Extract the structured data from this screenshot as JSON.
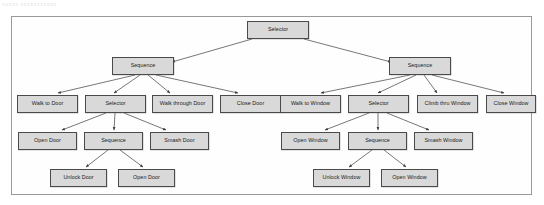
{
  "figure": {
    "caption_fragment": "xxxxx xxxxxxxxxxx",
    "frame_label": "behavior-tree-diagram"
  },
  "diagram": {
    "type": "behavior-tree",
    "node_types": [
      "Selector",
      "Sequence",
      "Action"
    ],
    "nodes": [
      {
        "id": "root",
        "label": "Selector",
        "type": "Selector",
        "x": 247,
        "y": 21,
        "w": 62,
        "h": 18
      },
      {
        "id": "seq-door",
        "label": "Sequence",
        "type": "Sequence",
        "x": 112,
        "y": 57,
        "w": 62,
        "h": 18
      },
      {
        "id": "seq-window",
        "label": "Sequence",
        "type": "Sequence",
        "x": 389,
        "y": 57,
        "w": 62,
        "h": 18
      },
      {
        "id": "walk-to-door",
        "label": "Walk to Door",
        "type": "Action",
        "x": 17,
        "y": 95,
        "w": 61,
        "h": 18
      },
      {
        "id": "sel-door",
        "label": "Selector",
        "type": "Selector",
        "x": 85,
        "y": 95,
        "w": 61,
        "h": 18
      },
      {
        "id": "walk-thru-door",
        "label": "Walk through Door",
        "type": "Action",
        "x": 152,
        "y": 95,
        "w": 61,
        "h": 18
      },
      {
        "id": "close-door",
        "label": "Close Door",
        "type": "Action",
        "x": 220,
        "y": 95,
        "w": 61,
        "h": 18
      },
      {
        "id": "walk-to-window",
        "label": "Walk to Window",
        "type": "Action",
        "x": 280,
        "y": 95,
        "w": 61,
        "h": 18
      },
      {
        "id": "sel-window",
        "label": "Selector",
        "type": "Selector",
        "x": 348,
        "y": 95,
        "w": 61,
        "h": 18
      },
      {
        "id": "climb-thru-win",
        "label": "Climb thru Window",
        "type": "Action",
        "x": 417,
        "y": 95,
        "w": 61,
        "h": 18
      },
      {
        "id": "close-window",
        "label": "Close Window",
        "type": "Action",
        "x": 486,
        "y": 95,
        "w": 50,
        "h": 18
      },
      {
        "id": "open-door-1",
        "label": "Open Door",
        "type": "Action",
        "x": 18,
        "y": 132,
        "w": 59,
        "h": 18
      },
      {
        "id": "seq-unlock-door",
        "label": "Sequence",
        "type": "Sequence",
        "x": 84,
        "y": 132,
        "w": 59,
        "h": 18
      },
      {
        "id": "smash-door",
        "label": "Smash Door",
        "type": "Action",
        "x": 150,
        "y": 132,
        "w": 59,
        "h": 18
      },
      {
        "id": "open-window-1",
        "label": "Open Window",
        "type": "Action",
        "x": 281,
        "y": 132,
        "w": 59,
        "h": 18
      },
      {
        "id": "seq-unlock-win",
        "label": "Sequence",
        "type": "Sequence",
        "x": 348,
        "y": 132,
        "w": 59,
        "h": 18
      },
      {
        "id": "smash-window",
        "label": "Smash Window",
        "type": "Action",
        "x": 414,
        "y": 132,
        "w": 59,
        "h": 18
      },
      {
        "id": "unlock-door",
        "label": "Unlock Door",
        "type": "Action",
        "x": 50,
        "y": 169,
        "w": 57,
        "h": 18
      },
      {
        "id": "open-door-2",
        "label": "Open Door",
        "type": "Action",
        "x": 118,
        "y": 169,
        "w": 57,
        "h": 18
      },
      {
        "id": "unlock-window",
        "label": "Unlock Window",
        "type": "Action",
        "x": 313,
        "y": 169,
        "w": 57,
        "h": 18
      },
      {
        "id": "open-window-2",
        "label": "Open Window",
        "type": "Action",
        "x": 381,
        "y": 169,
        "w": 57,
        "h": 18
      }
    ],
    "edges": [
      {
        "from": "root",
        "to": "seq-door",
        "x1": 252,
        "y1": 39,
        "x2": 172,
        "y2": 62
      },
      {
        "from": "root",
        "to": "seq-window",
        "x1": 304,
        "y1": 39,
        "x2": 391,
        "y2": 62
      },
      {
        "from": "seq-door",
        "to": "walk-to-door",
        "x1": 135,
        "y1": 75,
        "x2": 58,
        "y2": 93
      },
      {
        "from": "seq-door",
        "to": "sel-door",
        "x1": 140,
        "y1": 75,
        "x2": 114,
        "y2": 93
      },
      {
        "from": "seq-door",
        "to": "walk-thru-door",
        "x1": 148,
        "y1": 75,
        "x2": 170,
        "y2": 93
      },
      {
        "from": "seq-door",
        "to": "close-door",
        "x1": 156,
        "y1": 75,
        "x2": 238,
        "y2": 93
      },
      {
        "from": "seq-window",
        "to": "walk-to-window",
        "x1": 410,
        "y1": 75,
        "x2": 321,
        "y2": 93
      },
      {
        "from": "seq-window",
        "to": "sel-window",
        "x1": 416,
        "y1": 75,
        "x2": 378,
        "y2": 93
      },
      {
        "from": "seq-window",
        "to": "climb-thru-win",
        "x1": 424,
        "y1": 75,
        "x2": 437,
        "y2": 93
      },
      {
        "from": "seq-window",
        "to": "close-window",
        "x1": 432,
        "y1": 75,
        "x2": 504,
        "y2": 93
      },
      {
        "from": "sel-door",
        "to": "open-door-1",
        "x1": 106,
        "y1": 113,
        "x2": 62,
        "y2": 130
      },
      {
        "from": "sel-door",
        "to": "seq-unlock-door",
        "x1": 115,
        "y1": 113,
        "x2": 114,
        "y2": 130
      },
      {
        "from": "sel-door",
        "to": "smash-door",
        "x1": 124,
        "y1": 113,
        "x2": 166,
        "y2": 130
      },
      {
        "from": "sel-window",
        "to": "open-window-1",
        "x1": 369,
        "y1": 113,
        "x2": 325,
        "y2": 130
      },
      {
        "from": "sel-window",
        "to": "seq-unlock-win",
        "x1": 378,
        "y1": 113,
        "x2": 378,
        "y2": 130
      },
      {
        "from": "sel-window",
        "to": "smash-window",
        "x1": 387,
        "y1": 113,
        "x2": 429,
        "y2": 130
      },
      {
        "from": "seq-unlock-door",
        "to": "unlock-door",
        "x1": 108,
        "y1": 150,
        "x2": 86,
        "y2": 167
      },
      {
        "from": "seq-unlock-door",
        "to": "open-door-2",
        "x1": 120,
        "y1": 150,
        "x2": 143,
        "y2": 167
      },
      {
        "from": "seq-unlock-win",
        "to": "unlock-window",
        "x1": 372,
        "y1": 150,
        "x2": 349,
        "y2": 167
      },
      {
        "from": "seq-unlock-win",
        "to": "open-window-2",
        "x1": 384,
        "y1": 150,
        "x2": 406,
        "y2": 167
      }
    ]
  }
}
